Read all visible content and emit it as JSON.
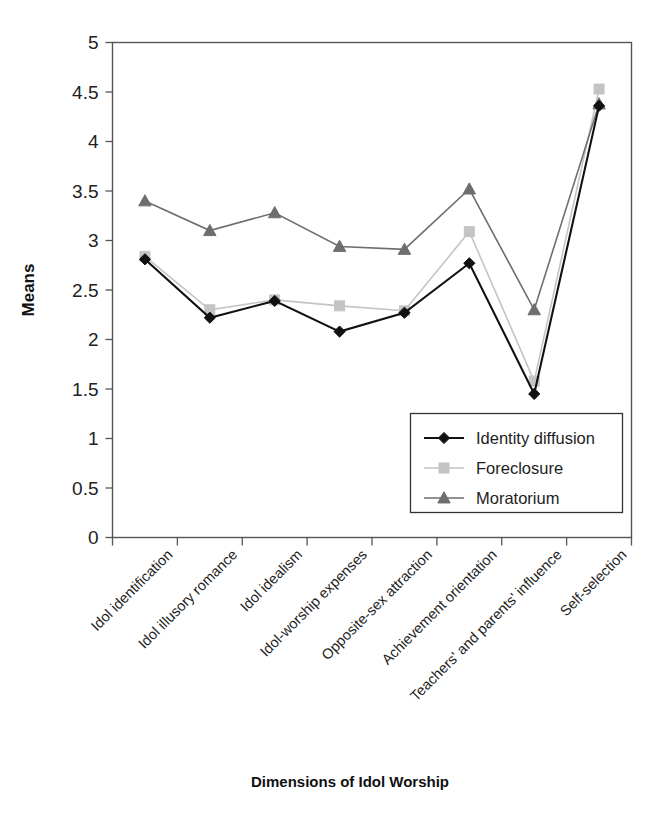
{
  "figure": {
    "page_artifact_text": "",
    "background_color": "#ffffff"
  },
  "chart_data": {
    "type": "line",
    "title": "",
    "xlabel": "Dimensions of Idol Worship",
    "ylabel": "Means",
    "ylim": [
      0,
      5
    ],
    "ytick_step": 0.5,
    "yticks": [
      "5",
      "4.5",
      "4",
      "3.5",
      "3",
      "2.5",
      "2",
      "1.5",
      "1",
      "0.5",
      "0"
    ],
    "grid": false,
    "legend_position": "inside-bottom-right",
    "categories": [
      "Idol identification",
      "Idol illusory romance",
      "Idol idealism",
      "Idol-worship expenses",
      "Opposite-sex attraction",
      "Achievement orientation",
      "Teachers' and parents' influence",
      "Self-selection"
    ],
    "series": [
      {
        "name": "Identity diffusion",
        "color": "#111111",
        "marker": "diamond",
        "values": [
          2.81,
          2.22,
          2.39,
          2.08,
          2.27,
          2.77,
          1.45,
          4.36
        ]
      },
      {
        "name": "Foreclosure",
        "color": "#c4c4c4",
        "marker": "square",
        "values": [
          2.84,
          2.3,
          2.4,
          2.34,
          2.29,
          3.09,
          1.58,
          4.53
        ]
      },
      {
        "name": "Moratorium",
        "color": "#6e6e6e",
        "marker": "triangle",
        "values": [
          3.4,
          3.1,
          3.28,
          2.94,
          2.91,
          3.52,
          2.3,
          4.38
        ]
      }
    ]
  }
}
